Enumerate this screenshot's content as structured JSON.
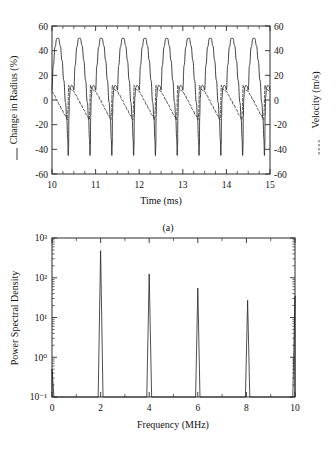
{
  "figure": {
    "panels": [
      {
        "id": "a",
        "caption": "(a)"
      },
      {
        "id": "b",
        "caption": "(b)"
      }
    ]
  },
  "panel_a": {
    "caption": "(a)",
    "left_axis_title": "Change in Radius (%)",
    "right_axis_title": "Velocity (m/s)",
    "x_axis_title": "Time (ms)",
    "left_legend_marker": "solid-line",
    "right_legend_marker": "dashed-line",
    "x_ticks": [
      "10",
      "11",
      "12",
      "13",
      "14",
      "15"
    ],
    "y_ticks_left": [
      "60",
      "40",
      "20",
      "0",
      "-20",
      "-40",
      "-60"
    ],
    "y_ticks_right": [
      "60",
      "40",
      "20",
      "0",
      "-20",
      "-40",
      "-60"
    ]
  },
  "panel_b": {
    "caption": "(b)",
    "y_axis_title": "Power Spectral Density",
    "x_axis_title": "Frequency (MHz)",
    "x_ticks": [
      "0",
      "2",
      "4",
      "6",
      "8",
      "10"
    ],
    "y_ticks": [
      "10⁻¹",
      "10⁰",
      "10¹",
      "10²",
      "10³"
    ]
  },
  "chart_data": [
    {
      "type": "line",
      "panel": "a",
      "title": "",
      "xlabel": "Time (ms)",
      "ylabel": "Change in Radius (%)",
      "y2label": "Velocity (m/s)",
      "xlim": [
        10,
        15
      ],
      "ylim": [
        -60,
        60
      ],
      "y2lim": [
        -60,
        60
      ],
      "xticks": [
        10,
        11,
        12,
        13,
        14,
        15
      ],
      "yticks": [
        -60,
        -40,
        -20,
        0,
        20,
        40,
        60
      ],
      "y2ticks": [
        -60,
        -40,
        -20,
        0,
        20,
        40,
        60
      ],
      "grid": false,
      "legend": "axis-label-prefix",
      "period_ms": 0.5,
      "n_cycles": 10,
      "series": [
        {
          "name": "Change in Radius (%)",
          "style": "solid",
          "axis": "left",
          "peak_max": 50,
          "peak_min": -45,
          "shape": "bubble-oscillation: smooth rounded expansion peak at +50 followed by narrow sharp collapse spike to -45",
          "cycle_profile_x_frac": [
            0.0,
            0.06,
            0.14,
            0.22,
            0.3,
            0.38,
            0.46,
            0.54,
            0.62,
            0.68,
            0.72,
            0.745,
            0.76,
            0.775,
            0.8,
            0.84,
            0.9,
            0.96,
            1.0
          ],
          "cycle_profile_y": [
            8,
            28,
            43,
            50,
            50,
            44,
            32,
            16,
            -2,
            -16,
            -32,
            -45,
            -38,
            -14,
            2,
            10,
            12,
            11,
            8
          ]
        },
        {
          "name": "Velocity (m/s)",
          "style": "dashed",
          "axis": "right",
          "peak_max": 12,
          "peak_min": -16,
          "shape": "sawtooth-like: slow decay from +7 down to -15 then sharp rise back to +12",
          "cycle_profile_x_frac": [
            0.0,
            0.1,
            0.22,
            0.34,
            0.46,
            0.58,
            0.66,
            0.71,
            0.735,
            0.75,
            0.765,
            0.79,
            0.84,
            0.9,
            1.0
          ],
          "cycle_profile_y": [
            7,
            4,
            0,
            -4,
            -8,
            -12,
            -14,
            -16,
            -8,
            4,
            12,
            11,
            9,
            8,
            7
          ]
        }
      ]
    },
    {
      "type": "line",
      "panel": "b",
      "title": "",
      "xlabel": "Frequency (MHz)",
      "ylabel": "Power Spectral Density",
      "xlim": [
        0,
        10
      ],
      "ylim": [
        0.1,
        1000
      ],
      "yscale": "log",
      "xticks": [
        0,
        2,
        4,
        6,
        8,
        10
      ],
      "xticks_minor": [
        1,
        3,
        5,
        7,
        9
      ],
      "yticks": [
        0.1,
        1,
        10,
        100,
        1000
      ],
      "ytick_labels": [
        "10⁻¹",
        "10⁰",
        "10¹",
        "10²",
        "10³"
      ],
      "grid": false,
      "baseline": 0.1,
      "peaks": [
        {
          "frequency": 0.0,
          "value": 0.5,
          "half_width": 0.08
        },
        {
          "frequency": 2.0,
          "value": 480,
          "half_width": 0.1
        },
        {
          "frequency": 4.0,
          "value": 125,
          "half_width": 0.1
        },
        {
          "frequency": 6.0,
          "value": 55,
          "half_width": 0.09
        },
        {
          "frequency": 8.05,
          "value": 27,
          "half_width": 0.09
        },
        {
          "frequency": 10.0,
          "value": 35,
          "half_width": 0.09
        }
      ]
    }
  ]
}
